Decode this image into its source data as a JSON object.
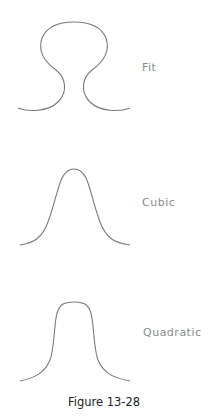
{
  "figure": {
    "caption": "Figure 13-28",
    "panels": [
      {
        "label": "Fit",
        "shape": "mushroom/keyhole closed-top curve"
      },
      {
        "label": "Cubic",
        "shape": "bell curve"
      },
      {
        "label": "Quadratic",
        "shape": "flat-topped bell curve"
      }
    ]
  },
  "colors": {
    "curve": "#7a7a7a",
    "label": "#8a8a8a",
    "caption": "#222222",
    "background": "#ffffff"
  }
}
